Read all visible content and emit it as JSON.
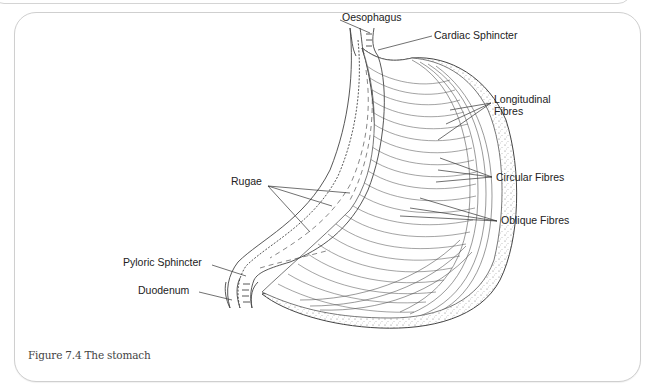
{
  "figure": {
    "caption": "Figure 7.4 The stomach",
    "subject": "stomach",
    "labels": {
      "oesophagus": "Oesophagus",
      "cardiac_sphincter": "Cardiac Sphincter",
      "longitudinal_fibres_line1": "Longitudinal",
      "longitudinal_fibres_line2": "Fibres",
      "circular_fibres": "Circular Fibres",
      "oblique_fibres": "Oblique Fibres",
      "rugae": "Rugae",
      "pyloric_sphincter": "Pyloric Sphincter",
      "duodenum": "Duodenum"
    },
    "colors": {
      "line": "#444444",
      "frame_border": "#cfcfcf",
      "stipple": "#777777"
    }
  }
}
